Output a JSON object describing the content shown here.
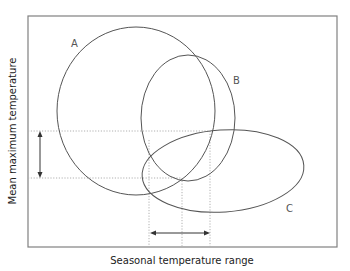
{
  "diagram": {
    "axes": {
      "x_label": "Seasonal temperature range",
      "y_label": "Mean maximum temperature"
    },
    "regions": [
      {
        "id": "A",
        "label": "A",
        "shape": "circle"
      },
      {
        "id": "B",
        "label": "B",
        "shape": "ellipse"
      },
      {
        "id": "C",
        "label": "C",
        "shape": "ellipse"
      }
    ],
    "indicators": {
      "vertical_arrow": "range of mean maximum temperature shared by A, B and C",
      "horizontal_arrow": "range of seasonal temperature range shared by A, B and C"
    },
    "colors": {
      "frame": "#808080",
      "curves": "#555555",
      "guides": "#b0b0b0",
      "arrows": "#333333"
    }
  }
}
